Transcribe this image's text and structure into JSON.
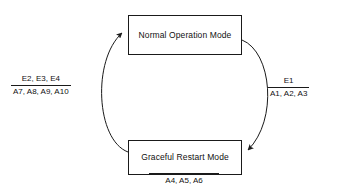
{
  "diagram": {
    "type": "state-transition-cycle",
    "background_color": "#ffffff",
    "stroke_color": "#1a1a1a",
    "text_color": "#111111",
    "nodes": [
      {
        "id": "normal-operation-mode",
        "label": "Normal Operation Mode",
        "shape": "rectangle",
        "position": "top"
      },
      {
        "id": "graceful-restart-mode",
        "label": "Graceful Restart Mode",
        "shape": "rectangle",
        "position": "bottom"
      }
    ],
    "edges": [
      {
        "id": "edge-normal-to-restart",
        "from": "normal-operation-mode",
        "to": "graceful-restart-mode",
        "side": "right",
        "style": "curved-arc",
        "arrowhead": "filled-triangle",
        "label": {
          "numerator": "E1",
          "denominator": "A1, A2, A3"
        }
      },
      {
        "id": "edge-restart-to-normal",
        "from": "graceful-restart-mode",
        "to": "normal-operation-mode",
        "side": "left",
        "style": "curved-arc",
        "arrowhead": "filled-triangle",
        "label": {
          "numerator": "E2, E3, E4",
          "denominator": "A7, A8, A9, A10"
        }
      }
    ],
    "annotations": [
      {
        "id": "self-action-graceful-restart",
        "attached_to": "graceful-restart-mode",
        "position": "below",
        "rule": "above",
        "text": "A4, A5, A6"
      }
    ]
  }
}
